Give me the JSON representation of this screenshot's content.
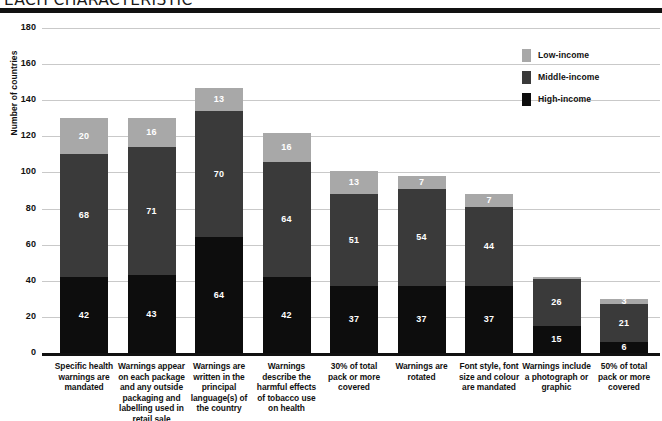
{
  "header": {
    "title": "EACH CHARACTERISTIC"
  },
  "chart_data": {
    "type": "bar",
    "stacked": true,
    "title": "EACH CHARACTERISTIC",
    "xlabel": "",
    "ylabel": "Number of countries",
    "ylim": [
      0,
      180
    ],
    "ytick_step": 20,
    "yticks": [
      "180",
      "160",
      "140",
      "120",
      "100",
      "80",
      "60",
      "40",
      "20",
      "0"
    ],
    "grid": true,
    "legend_position": "top-right",
    "categories": [
      "Specific health warnings are mandated",
      "Warnings appear on each package and any outside packaging and labelling used in retail sale",
      "Warnings are written in the principal language(s) of the country",
      "Warnings describe the harmful effects of tobacco use on health",
      "30% of total pack or more covered",
      "Warnings are rotated",
      "Font style, font size and colour are mandated",
      "Warnings include a photograph or graphic",
      "50% of total pack or more covered"
    ],
    "category_lines": [
      [
        "Specific health",
        "warnings are",
        "mandated"
      ],
      [
        "Warnings appear",
        "on each package",
        "and any outside",
        "packaging and",
        "labelling used in",
        "retail sale"
      ],
      [
        "Warnings are",
        "written in the",
        "principal",
        "language(s) of",
        "the country"
      ],
      [
        "Warnings",
        "describe the",
        "harmful effects",
        "of tobacco use",
        "on health"
      ],
      [
        "30% of total",
        "pack or more",
        "covered"
      ],
      [
        "Warnings are",
        "rotated"
      ],
      [
        "Font style, font",
        "size and colour",
        "are mandated"
      ],
      [
        "Warnings include",
        "a photograph or",
        "graphic"
      ],
      [
        "50% of total",
        "pack or more",
        "covered"
      ]
    ],
    "series": [
      {
        "name": "High-income",
        "color": "#0d0d0d",
        "values": [
          42,
          43,
          64,
          42,
          37,
          37,
          37,
          15,
          6
        ],
        "labels": [
          "42",
          "43",
          "64",
          "42",
          "37",
          "37",
          "37",
          "15",
          "6"
        ]
      },
      {
        "name": "Middle-income",
        "color": "#3a3a3a",
        "values": [
          68,
          71,
          70,
          64,
          51,
          54,
          44,
          26,
          21
        ],
        "labels": [
          "68",
          "71",
          "70",
          "64",
          "51",
          "54",
          "44",
          "26",
          "21"
        ]
      },
      {
        "name": "Low-income",
        "color": "#a8a8a8",
        "values": [
          20,
          16,
          13,
          16,
          13,
          7,
          7,
          1,
          3
        ],
        "labels": [
          "20",
          "16",
          "13",
          "16",
          "13",
          "7",
          "7",
          "",
          "3"
        ]
      }
    ],
    "totals": [
      130,
      130,
      147,
      122,
      101,
      98,
      88,
      42,
      30
    ]
  },
  "legend": {
    "items": [
      {
        "label": "Low-income",
        "color": "#a8a8a8"
      },
      {
        "label": "Middle-income",
        "color": "#3a3a3a"
      },
      {
        "label": "High-income",
        "color": "#0d0d0d"
      }
    ]
  }
}
